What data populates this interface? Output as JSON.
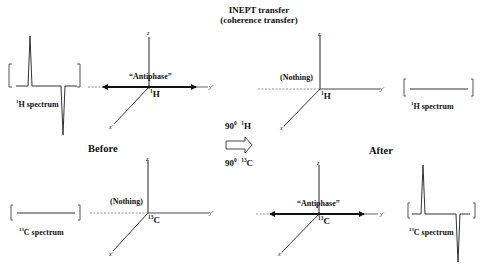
{
  "title": {
    "line1": "INEPT transfer",
    "line2": "(coherence transfer)"
  },
  "pulses": {
    "h": {
      "angle": "90",
      "degree": "0",
      "isotope_mass": "1",
      "nucleus": "H"
    },
    "c": {
      "angle": "90",
      "degree": "0",
      "isotope_mass": "13",
      "nucleus": "C"
    }
  },
  "phases": {
    "before": "Before",
    "after": "After"
  },
  "panels": {
    "h_before": {
      "state_label": "“Antiphase”",
      "nucleus_mass": "1",
      "nucleus": "H",
      "axes": {
        "z": "z",
        "y": "y'",
        "x": "x'"
      },
      "spectrum_label_mass": "1",
      "spectrum_label": "H spectrum",
      "spectrum_type": "antiphase"
    },
    "h_after": {
      "state_label": "(Nothing)",
      "nucleus_mass": "1",
      "nucleus": "H",
      "axes": {
        "z": "z",
        "y": "y'",
        "x": "x'"
      },
      "spectrum_label_mass": "1",
      "spectrum_label": "H spectrum",
      "spectrum_type": "flat"
    },
    "c_before": {
      "state_label": "(Nothing)",
      "nucleus_mass": "13",
      "nucleus": "C",
      "axes": {
        "z": "z",
        "y": "y'",
        "x": "x'"
      },
      "spectrum_label_mass": "13",
      "spectrum_label": "C spectrum",
      "spectrum_type": "flat"
    },
    "c_after": {
      "state_label": "“Antiphase”",
      "nucleus_mass": "13",
      "nucleus": "C",
      "axes": {
        "z": "z",
        "y": "y'",
        "x": "x'"
      },
      "spectrum_label_mass": "13",
      "spectrum_label": "C spectrum",
      "spectrum_type": "antiphase"
    }
  },
  "brackets": {
    "open": "[",
    "close": "]"
  },
  "colors": {
    "ink": "#111111",
    "background": "#ffffff"
  }
}
